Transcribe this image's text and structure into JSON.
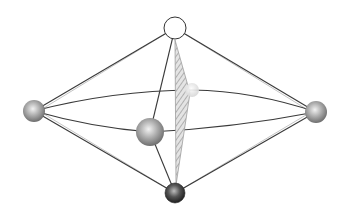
{
  "diagram": {
    "type": "molecular-geometry",
    "colors": {
      "background": "#ffffff",
      "edge": "#3a3a3a",
      "sphere_gray": "#9a9a9a",
      "sphere_dark": "#3c3c3c",
      "sphere_top_fill": "#ffffff",
      "hatch": "#9e9e9e"
    },
    "nodes": [
      {
        "id": "top",
        "cx": 175,
        "cy": 28,
        "r": 11,
        "style": "hollow"
      },
      {
        "id": "left",
        "cx": 34,
        "cy": 111,
        "r": 11,
        "style": "gray"
      },
      {
        "id": "right",
        "cx": 316,
        "cy": 112,
        "r": 11,
        "style": "gray"
      },
      {
        "id": "front",
        "cx": 150,
        "cy": 132,
        "r": 14,
        "style": "gray"
      },
      {
        "id": "back",
        "cx": 192,
        "cy": 90,
        "r": 7,
        "style": "faint"
      },
      {
        "id": "bottom",
        "cx": 175,
        "cy": 193,
        "r": 10,
        "style": "dark"
      }
    ],
    "edges": [
      [
        "top",
        "left"
      ],
      [
        "top",
        "right"
      ],
      [
        "top",
        "front"
      ],
      [
        "bottom",
        "left"
      ],
      [
        "bottom",
        "right"
      ],
      [
        "bottom",
        "front"
      ],
      [
        "left",
        "front"
      ],
      [
        "front",
        "right"
      ],
      [
        "left",
        "back"
      ],
      [
        "back",
        "right"
      ]
    ],
    "equator_curves": true,
    "hatched_plane": [
      [
        175,
        40
      ],
      [
        190,
        93
      ],
      [
        176,
        185
      ]
    ]
  }
}
